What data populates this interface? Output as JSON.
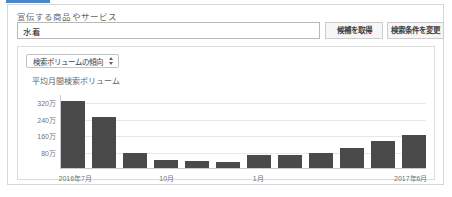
{
  "form": {
    "field_label": "宣伝する商品やサービス",
    "keyword_value": "水着",
    "keyword_placeholder": "商品やサービスを入力",
    "fetch_button": "候補を取得",
    "modify_button": "検索条件を変更"
  },
  "chart_panel": {
    "metric_select_value": "検索ボリュームの傾向",
    "chart_title": "平均月間検索ボリューム"
  },
  "chart_data": {
    "type": "bar",
    "title": "平均月間検索ボリューム",
    "xlabel": "",
    "ylabel": "",
    "categories": [
      "2016年7月",
      "2016年8月",
      "2016年9月",
      "2016年10月",
      "2016年11月",
      "2016年12月",
      "2017年1月",
      "2017年2月",
      "2017年3月",
      "2017年4月",
      "2017年5月",
      "2017年6月"
    ],
    "values": [
      3300000,
      2500000,
      740000,
      400000,
      330000,
      300000,
      620000,
      620000,
      740000,
      1000000,
      1350000,
      1650000
    ],
    "ylim": [
      0,
      3600000
    ],
    "yticks": [
      800000,
      1600000,
      2400000,
      3200000
    ],
    "ytick_labels": [
      "80万",
      "160万",
      "240万",
      "320万"
    ],
    "xtick_positions": [
      0,
      3,
      6,
      11
    ],
    "xtick_labels": [
      "2016年7月",
      "10月",
      "1月",
      "2017年6月"
    ],
    "grid": true,
    "legend": "none",
    "bar_color": "#4a4a4a"
  }
}
